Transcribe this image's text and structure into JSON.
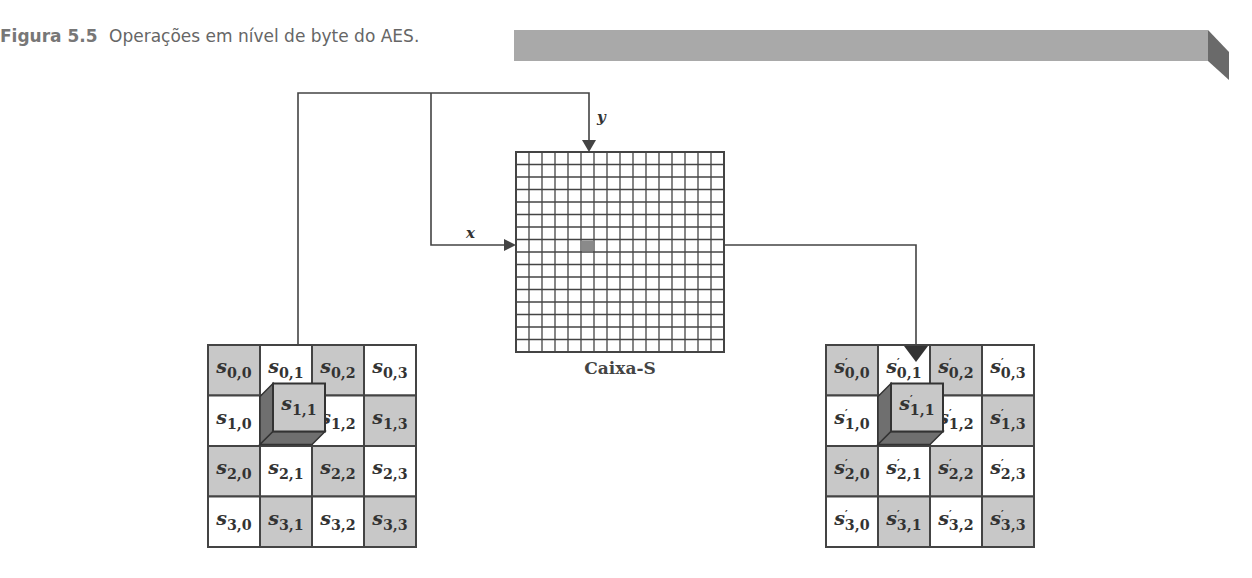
{
  "caption": {
    "figure_label": "Figura 5.5",
    "title": "Operações em nível de byte do AES."
  },
  "sbox": {
    "label": "Caixa-S",
    "rows": 16,
    "cols": 16,
    "highlight": {
      "row": 7,
      "col": 5
    },
    "input_x_label": "x",
    "input_y_label": "y"
  },
  "input_state": {
    "name": "s",
    "cells": [
      [
        "s0,0",
        "s0,1",
        "s0,2",
        "s0,3"
      ],
      [
        "s1,0",
        "s1,1",
        "s1,2",
        "s1,3"
      ],
      [
        "s2,0",
        "s2,1",
        "s2,2",
        "s2,3"
      ],
      [
        "s3,0",
        "s3,1",
        "s3,2",
        "s3,3"
      ]
    ],
    "selected": {
      "row": 1,
      "col": 1
    }
  },
  "output_state": {
    "name": "s'",
    "cells": [
      [
        "s'0,0",
        "s'0,1",
        "s'0,2",
        "s'0,3"
      ],
      [
        "s'1,0",
        "s'1,1",
        "s'1,2",
        "s'1,3"
      ],
      [
        "s'2,0",
        "s'2,1",
        "s'2,2",
        "s'2,3"
      ],
      [
        "s'3,0",
        "s'3,1",
        "s'3,2",
        "s'3,3"
      ]
    ],
    "selected": {
      "row": 1,
      "col": 1
    }
  },
  "colors": {
    "shaded_cell": "#c8c8c8",
    "white_cell": "#ffffff",
    "line": "#444444",
    "cube_side": "#6f6f6f",
    "banner": "#a9a9a9",
    "banner_fold": "#6a6a6a",
    "sbox_highlight": "#8a8a8a"
  }
}
